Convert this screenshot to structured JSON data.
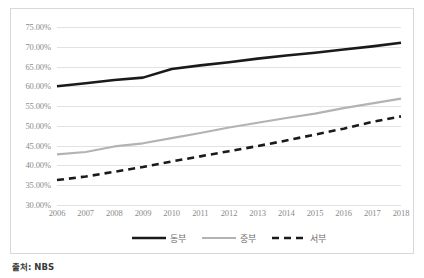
{
  "chart_data": {
    "type": "line",
    "title": "",
    "xlabel": "",
    "ylabel": "",
    "categories": [
      "2006",
      "2007",
      "2008",
      "2009",
      "2010",
      "2011",
      "2012",
      "2013",
      "2014",
      "2015",
      "2016",
      "2017",
      "2018"
    ],
    "ylim": [
      30,
      75
    ],
    "ytick_labels": [
      "75.00%",
      "70.00%",
      "65.00%",
      "60.00%",
      "55.00%",
      "50.00%",
      "45.00%",
      "40.00%",
      "35.00%",
      "30.00%"
    ],
    "ytick_values": [
      75,
      70,
      65,
      60,
      55,
      50,
      45,
      40,
      35,
      30
    ],
    "grid": true,
    "legend_position": "bottom-center",
    "series": [
      {
        "name": "동부",
        "color": "#1a1a1a",
        "style": "solid",
        "width": 2.6,
        "values": [
          60.0,
          60.8,
          61.6,
          62.2,
          64.4,
          65.3,
          66.1,
          67.0,
          67.8,
          68.5,
          69.3,
          70.1,
          71.0
        ]
      },
      {
        "name": "중부",
        "color": "#b3b3b3",
        "style": "solid",
        "width": 2.2,
        "values": [
          42.8,
          43.4,
          44.8,
          45.6,
          46.9,
          48.2,
          49.6,
          50.8,
          52.0,
          53.1,
          54.5,
          55.7,
          56.9
        ]
      },
      {
        "name": "서부",
        "color": "#1a1a1a",
        "style": "dashed",
        "width": 2.6,
        "values": [
          36.3,
          37.2,
          38.4,
          39.6,
          41.0,
          42.3,
          43.6,
          44.9,
          46.3,
          47.8,
          49.3,
          51.0,
          52.4
        ]
      }
    ]
  },
  "caption": {
    "source": "출처: NBS"
  },
  "colors": {
    "gridline": "#e2e2e2",
    "tick_text": "#8a8a8a",
    "legend_text": "#6d6d6d",
    "frame_border": "#d8d8d8",
    "series_dark": "#1a1a1a",
    "series_gray": "#b3b3b3"
  }
}
